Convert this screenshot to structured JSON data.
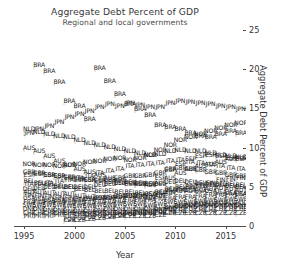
{
  "chart_data": {
    "type": "scatter",
    "title": "Aggregate Debt Percent of GDP",
    "subtitle": "Regional and local governments",
    "xlabel": "Year",
    "ylabel": "Aggregate Debt Percent of GDP",
    "xlim": [
      1994,
      2017
    ],
    "ylim": [
      0,
      25
    ],
    "xticks": [
      1995,
      2000,
      2005,
      2010,
      2015
    ],
    "yticks": [
      0,
      5,
      10,
      15,
      20,
      25
    ],
    "grid": false,
    "legend": "none",
    "point_marker": "country-code-text",
    "note": "Each data point is drawn as its 3-letter ISO country code rather than a symbol; labels overlap heavily in the dense 0-8 percent band.",
    "series": [
      {
        "name": "BRA",
        "x": [
          1996,
          1997,
          1998,
          1999,
          2000,
          2001,
          2002,
          2003,
          2004,
          2005,
          2006,
          2007,
          2008,
          2009,
          2010,
          2011,
          2012,
          2013,
          2014,
          2015,
          2016
        ],
        "values": [
          20.2,
          19.4,
          18.0,
          15.6,
          15.0,
          13.3,
          19.8,
          18.2,
          16.5,
          15.3,
          14.6,
          13.9,
          12.6,
          12.3,
          12.1,
          11.6,
          11.2,
          11.0,
          11.4,
          11.8,
          11.5
        ]
      },
      {
        "name": "JPN",
        "x": [
          1995,
          1996,
          1997,
          1998,
          1999,
          2000,
          2001,
          2002,
          2003,
          2004,
          2005,
          2006,
          2007,
          2008,
          2009,
          2010,
          2011,
          2012,
          2013,
          2014,
          2015,
          2016
        ],
        "values": [
          11.6,
          12.0,
          12.4,
          13.0,
          13.6,
          14.0,
          14.4,
          14.8,
          15.2,
          15.0,
          15.4,
          15.1,
          14.8,
          14.9,
          15.4,
          15.6,
          15.5,
          15.4,
          15.2,
          15.0,
          14.8,
          14.6
        ]
      },
      {
        "name": "NLD",
        "x": [
          1995,
          1996,
          1997,
          1998,
          1999,
          2000,
          2001,
          2002,
          2003,
          2004,
          2005,
          2006,
          2007,
          2008,
          2009,
          2010,
          2011,
          2012,
          2013,
          2014,
          2015,
          2016
        ],
        "values": [
          12.0,
          11.7,
          11.4,
          11.2,
          11.0,
          10.6,
          10.3,
          10.0,
          9.8,
          9.5,
          9.2,
          9.0,
          8.7,
          8.9,
          9.2,
          9.4,
          9.3,
          9.2,
          9.0,
          8.8,
          8.6,
          8.5
        ]
      },
      {
        "name": "NOR",
        "x": [
          1995,
          1996,
          1997,
          1998,
          1999,
          2000,
          2001,
          2002,
          2003,
          2004,
          2005,
          2006,
          2007,
          2008,
          2009,
          2010,
          2011,
          2012,
          2013,
          2014,
          2015,
          2016
        ],
        "values": [
          7.6,
          7.5,
          7.4,
          7.3,
          7.4,
          7.6,
          7.8,
          8.0,
          8.2,
          8.3,
          8.1,
          8.4,
          8.8,
          9.4,
          10.0,
          10.6,
          11.0,
          11.4,
          11.8,
          12.2,
          12.6,
          12.8
        ]
      },
      {
        "name": "AUS",
        "x": [
          1995,
          1996,
          1997,
          1998,
          1999,
          2000,
          2001,
          2002,
          2003,
          2004,
          2005,
          2006,
          2007,
          2008,
          2009,
          2010,
          2011,
          2012,
          2013,
          2014,
          2015,
          2016
        ],
        "values": [
          9.6,
          9.2,
          8.6,
          8.0,
          7.4,
          7.0,
          6.6,
          6.2,
          5.8,
          5.5,
          5.2,
          5.0,
          4.9,
          5.2,
          5.8,
          6.4,
          6.9,
          7.3,
          7.6,
          7.9,
          8.2,
          8.4
        ]
      },
      {
        "name": "GBR",
        "x": [
          1995,
          1996,
          1997,
          1998,
          1999,
          2000,
          2001,
          2002,
          2003,
          2004,
          2005,
          2006,
          2007,
          2008,
          2009,
          2010,
          2011,
          2012,
          2013,
          2014,
          2015,
          2016
        ],
        "values": [
          6.6,
          6.4,
          6.2,
          6.0,
          5.9,
          5.7,
          5.6,
          5.5,
          5.6,
          5.8,
          6.0,
          6.1,
          6.2,
          6.5,
          6.9,
          7.1,
          7.0,
          6.8,
          6.6,
          6.4,
          6.2,
          6.0
        ]
      },
      {
        "name": "ITA",
        "x": [
          1995,
          1996,
          1997,
          1998,
          1999,
          2000,
          2001,
          2002,
          2003,
          2004,
          2005,
          2006,
          2007,
          2008,
          2009,
          2010,
          2011,
          2012,
          2013,
          2014,
          2015,
          2016
        ],
        "values": [
          5.0,
          5.1,
          5.2,
          5.4,
          5.6,
          5.8,
          6.1,
          6.4,
          6.7,
          7.0,
          7.3,
          7.5,
          7.6,
          7.7,
          8.0,
          8.1,
          7.9,
          7.7,
          7.5,
          7.3,
          7.1,
          6.9
        ]
      },
      {
        "name": "USA",
        "x": [
          1995,
          1996,
          1997,
          1998,
          1999,
          2000,
          2001,
          2002,
          2003,
          2004,
          2005,
          2006,
          2007,
          2008,
          2009,
          2010,
          2011,
          2012,
          2013,
          2014,
          2015,
          2016
        ],
        "values": [
          3.2,
          3.1,
          3.0,
          3.0,
          3.0,
          3.0,
          3.1,
          3.3,
          3.4,
          3.5,
          3.5,
          3.6,
          3.7,
          3.9,
          4.3,
          4.4,
          4.3,
          4.2,
          4.1,
          4.0,
          3.9,
          3.8
        ]
      },
      {
        "name": "DEU",
        "x": [
          1995,
          1996,
          1997,
          1998,
          1999,
          2000,
          2001,
          2002,
          2003,
          2004,
          2005,
          2006,
          2007,
          2008,
          2009,
          2010,
          2011,
          2012,
          2013,
          2014,
          2015,
          2016
        ],
        "values": [
          4.4,
          4.5,
          4.6,
          4.6,
          4.7,
          4.6,
          4.7,
          4.9,
          5.1,
          5.2,
          5.3,
          5.2,
          5.0,
          5.0,
          5.3,
          5.4,
          5.3,
          5.2,
          5.0,
          4.9,
          4.8,
          4.7
        ]
      },
      {
        "name": "AUT",
        "x": [
          1995,
          1996,
          1997,
          1998,
          1999,
          2000,
          2001,
          2002,
          2003,
          2004,
          2005,
          2006,
          2007,
          2008,
          2009,
          2010,
          2011,
          2012,
          2013,
          2014,
          2015,
          2016
        ],
        "values": [
          4.0,
          4.0,
          3.9,
          3.8,
          3.7,
          3.5,
          3.4,
          3.3,
          3.3,
          3.4,
          3.5,
          3.4,
          3.3,
          3.5,
          3.9,
          4.1,
          4.2,
          4.3,
          4.4,
          4.5,
          4.4,
          4.3
        ]
      },
      {
        "name": "FIN",
        "x": [
          1995,
          1996,
          1997,
          1998,
          1999,
          2000,
          2001,
          2002,
          2003,
          2004,
          2005,
          2006,
          2007,
          2008,
          2009,
          2010,
          2011,
          2012,
          2013,
          2014,
          2015,
          2016
        ],
        "values": [
          3.6,
          3.5,
          3.4,
          3.3,
          3.2,
          3.1,
          3.1,
          3.2,
          3.3,
          3.4,
          3.5,
          3.5,
          3.4,
          3.6,
          4.0,
          4.3,
          4.6,
          4.9,
          5.2,
          5.5,
          5.7,
          5.8
        ]
      },
      {
        "name": "ESP",
        "x": [
          1995,
          1996,
          1997,
          1998,
          1999,
          2000,
          2001,
          2002,
          2003,
          2004,
          2005,
          2006,
          2007,
          2008,
          2009,
          2010,
          2011,
          2012,
          2013,
          2014,
          2015,
          2016
        ],
        "values": [
          6.2,
          6.3,
          6.2,
          6.0,
          5.8,
          5.6,
          5.5,
          5.4,
          5.3,
          5.2,
          5.1,
          5.0,
          5.1,
          5.8,
          6.8,
          7.6,
          8.2,
          8.6,
          8.8,
          8.6,
          8.4,
          8.2
        ]
      },
      {
        "name": "BEL",
        "x": [
          1995,
          1996,
          1997,
          1998,
          1999,
          2000,
          2001,
          2002,
          2003,
          2004,
          2005,
          2006,
          2007,
          2008,
          2009,
          2010,
          2011,
          2012,
          2013,
          2014,
          2015,
          2016
        ],
        "values": [
          5.4,
          5.2,
          5.0,
          4.8,
          4.6,
          4.4,
          4.3,
          4.2,
          4.1,
          4.0,
          4.0,
          3.9,
          3.8,
          4.0,
          4.4,
          4.6,
          4.7,
          4.8,
          4.9,
          5.0,
          5.0,
          4.9
        ]
      },
      {
        "name": "FRA",
        "x": [
          1995,
          1996,
          1997,
          1998,
          1999,
          2000,
          2001,
          2002,
          2003,
          2004,
          2005,
          2006,
          2007,
          2008,
          2009,
          2010,
          2011,
          2012,
          2013,
          2014,
          2015,
          2016
        ],
        "values": [
          2.8,
          2.8,
          2.7,
          2.7,
          2.6,
          2.6,
          2.6,
          2.7,
          2.8,
          2.9,
          3.0,
          3.0,
          3.0,
          3.1,
          3.3,
          3.4,
          3.4,
          3.5,
          3.6,
          3.6,
          3.7,
          3.7
        ]
      },
      {
        "name": "SWE",
        "x": [
          1995,
          1996,
          1997,
          1998,
          1999,
          2000,
          2001,
          2002,
          2003,
          2004,
          2005,
          2006,
          2007,
          2008,
          2009,
          2010,
          2011,
          2012,
          2013,
          2014,
          2015,
          2016
        ],
        "values": [
          2.4,
          2.4,
          2.3,
          2.3,
          2.2,
          2.2,
          2.2,
          2.3,
          2.4,
          2.5,
          2.5,
          2.5,
          2.4,
          2.5,
          2.7,
          2.8,
          2.8,
          2.9,
          3.0,
          3.0,
          3.1,
          3.1
        ]
      },
      {
        "name": "DNK",
        "x": [
          1995,
          1996,
          1997,
          1998,
          1999,
          2000,
          2001,
          2002,
          2003,
          2004,
          2005,
          2006,
          2007,
          2008,
          2009,
          2010,
          2011,
          2012,
          2013,
          2014,
          2015,
          2016
        ],
        "values": [
          1.8,
          1.8,
          1.7,
          1.7,
          1.6,
          1.6,
          1.6,
          1.7,
          1.8,
          1.8,
          1.9,
          1.9,
          1.8,
          1.9,
          2.1,
          2.2,
          2.2,
          2.3,
          2.3,
          2.4,
          2.4,
          2.4
        ]
      },
      {
        "name": "CHE",
        "x": [
          1995,
          1996,
          1997,
          1998,
          1999,
          2000,
          2001,
          2002,
          2003,
          2004,
          2005,
          2006,
          2007,
          2008,
          2009,
          2010,
          2011,
          2012,
          2013,
          2014,
          2015,
          2016
        ],
        "values": [
          1.4,
          1.4,
          1.3,
          1.3,
          1.3,
          1.2,
          1.2,
          1.3,
          1.3,
          1.4,
          1.4,
          1.4,
          1.3,
          1.4,
          1.5,
          1.6,
          1.6,
          1.7,
          1.7,
          1.8,
          1.8,
          1.8
        ]
      },
      {
        "name": "PRT",
        "x": [
          1995,
          1996,
          1997,
          1998,
          1999,
          2000,
          2001,
          2002,
          2003,
          2004,
          2005,
          2006,
          2007,
          2008,
          2009,
          2010,
          2011,
          2012,
          2013,
          2014,
          2015,
          2016
        ],
        "values": [
          1.0,
          1.0,
          1.0,
          1.1,
          1.1,
          1.2,
          1.2,
          1.3,
          1.3,
          1.4,
          1.4,
          1.5,
          1.5,
          1.7,
          1.9,
          2.0,
          2.1,
          2.1,
          2.2,
          2.2,
          2.2,
          2.1
        ]
      },
      {
        "name": "POL",
        "x": [
          1999,
          2000,
          2001,
          2002,
          2003,
          2004,
          2005,
          2006,
          2007,
          2008,
          2009,
          2010,
          2011,
          2012,
          2013,
          2014,
          2015,
          2016
        ],
        "values": [
          0.6,
          0.7,
          0.8,
          0.9,
          1.0,
          1.1,
          1.2,
          1.3,
          1.3,
          1.5,
          1.9,
          2.2,
          2.4,
          2.5,
          2.5,
          2.6,
          2.6,
          2.6
        ]
      },
      {
        "name": "CZE",
        "x": [
          1999,
          2000,
          2001,
          2002,
          2003,
          2004,
          2005,
          2006,
          2007,
          2008,
          2009,
          2010,
          2011,
          2012,
          2013,
          2014,
          2015,
          2016
        ],
        "values": [
          0.4,
          0.5,
          0.6,
          0.7,
          0.8,
          0.9,
          0.9,
          1.0,
          1.0,
          1.1,
          1.3,
          1.4,
          1.4,
          1.4,
          1.4,
          1.4,
          1.4,
          1.3
        ]
      }
    ]
  }
}
